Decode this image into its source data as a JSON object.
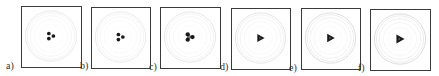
{
  "figure": {
    "panels": [
      {
        "label": "a)",
        "box": [
          21,
          6,
          61,
          62
        ],
        "label_pos": [
          6,
          61
        ],
        "core": "trefoil-dots",
        "core_scale": 1.0,
        "ring_opacity": 0.35
      },
      {
        "label": "b)",
        "box": [
          91,
          7,
          60,
          62
        ],
        "label_pos": [
          80,
          61
        ],
        "core": "trefoil-dots",
        "core_scale": 1.0,
        "ring_opacity": 0.35
      },
      {
        "label": "c)",
        "box": [
          160,
          7,
          61,
          62
        ],
        "label_pos": [
          149,
          62
        ],
        "core": "trefoil-mixed",
        "core_scale": 1.05,
        "ring_opacity": 0.4
      },
      {
        "label": "d)",
        "box": [
          231,
          8,
          60,
          62
        ],
        "label_pos": [
          220,
          62
        ],
        "core": "triangle",
        "core_scale": 1.1,
        "ring_opacity": 0.45
      },
      {
        "label": "e)",
        "box": [
          301,
          8,
          60,
          62
        ],
        "label_pos": [
          289,
          63
        ],
        "core": "triangle",
        "core_scale": 1.15,
        "ring_opacity": 0.55
      },
      {
        "label": "f)",
        "box": [
          370,
          9,
          61,
          62
        ],
        "label_pos": [
          358,
          63
        ],
        "core": "triangle",
        "core_scale": 1.2,
        "ring_opacity": 0.6
      }
    ],
    "colors": {
      "border": "#3a3a3a",
      "core": "#1a1a1a",
      "ring": "#bdbdbd",
      "label": "#333333"
    }
  }
}
